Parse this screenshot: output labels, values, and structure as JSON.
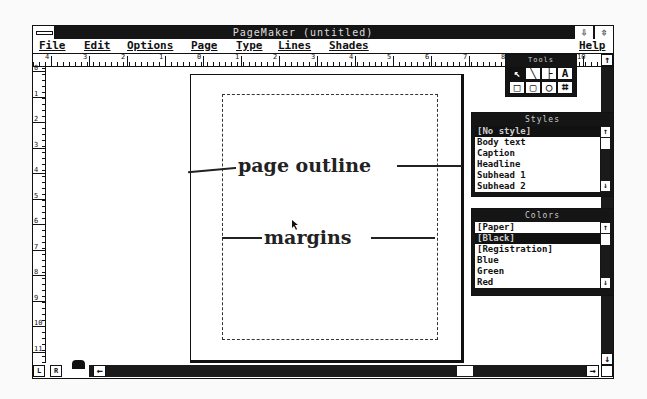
{
  "window": {
    "title": "PageMaker   (untitled)",
    "minimize_glyph": "⇩",
    "maximize_glyph": "⇳"
  },
  "menubar": {
    "items": [
      {
        "label": "File",
        "x": 6
      },
      {
        "label": "Edit",
        "x": 51
      },
      {
        "label": "Options",
        "x": 94
      },
      {
        "label": "Page",
        "x": 158
      },
      {
        "label": "Type",
        "x": 203
      },
      {
        "label": "Lines",
        "x": 245
      },
      {
        "label": "Shades",
        "x": 296
      },
      {
        "label": "Help",
        "x": 546
      }
    ]
  },
  "rulers": {
    "horizontal_labels": [
      "4",
      "3",
      "2",
      "1",
      "0",
      "1",
      "2",
      "3",
      "4",
      "5",
      "6",
      "7",
      "8",
      "9",
      "10"
    ],
    "vertical_labels": [
      "0",
      "1",
      "2",
      "3",
      "4",
      "5",
      "6",
      "7",
      "8",
      "9",
      "10",
      "11"
    ]
  },
  "toolbox": {
    "title": "Tools",
    "tools": [
      {
        "name": "pointer",
        "glyph": "↖",
        "selected": true
      },
      {
        "name": "diagonal-line",
        "glyph": "╲",
        "selected": false
      },
      {
        "name": "perpendicular-line",
        "glyph": "├",
        "selected": false
      },
      {
        "name": "text",
        "glyph": "A",
        "selected": false
      },
      {
        "name": "square-corner-rect",
        "glyph": "□",
        "selected": false
      },
      {
        "name": "rounded-rect",
        "glyph": "▢",
        "selected": false
      },
      {
        "name": "oval",
        "glyph": "○",
        "selected": false
      },
      {
        "name": "crop",
        "glyph": "⌗",
        "selected": false
      }
    ]
  },
  "styles_palette": {
    "title": "Styles",
    "items": [
      "[No style]",
      "Body text",
      "Caption",
      "Headline",
      "Subhead 1",
      "Subhead 2"
    ],
    "selected_index": 0
  },
  "colors_palette": {
    "title": "Colors",
    "items": [
      "[Paper]",
      "[Black]",
      "[Registration]",
      "Blue",
      "Green",
      "Red"
    ],
    "selected_index": 1
  },
  "annotations": {
    "page_outline": "page outline",
    "margins": "margins"
  },
  "page_controls": {
    "left_page": "L",
    "right_page": "R"
  },
  "scrollbars": {
    "left_arrow": "←",
    "right_arrow": "→",
    "up_arrow": "↑",
    "down_arrow": "↓"
  }
}
